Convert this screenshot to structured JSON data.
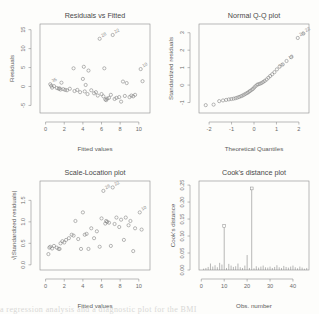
{
  "figure": {
    "background": "#fdfdfb",
    "foreground": "#6a6a6a",
    "layout": "2x2",
    "bottom_cutoff_text": "a regression analysis and a diagnostic plot for the BMI"
  },
  "chart_data": [
    {
      "type": "scatter",
      "title": "Residuals vs Fitted",
      "xlabel": "Fitted values",
      "ylabel": "Residuals",
      "xlim": [
        -0.6,
        11.2
      ],
      "ylim": [
        -7.0,
        16.5
      ],
      "xticks": [
        0,
        2,
        4,
        6,
        8,
        10
      ],
      "yticks": [
        -5,
        0,
        5,
        10,
        15
      ],
      "grid": false,
      "legend": "none",
      "x": [
        0.5,
        0.6,
        0.7,
        0.9,
        1.2,
        1.4,
        1.5,
        1.6,
        1.7,
        1.9,
        2.1,
        2.3,
        2.6,
        3.0,
        3.1,
        3.4,
        3.7,
        4.0,
        4.1,
        4.2,
        4.3,
        4.5,
        4.6,
        4.9,
        5.2,
        5.4,
        5.6,
        5.8,
        6.0,
        6.2,
        6.3,
        6.4,
        6.5,
        6.6,
        6.8,
        7.0,
        7.2,
        7.4,
        7.6,
        7.9,
        8.1,
        8.3,
        8.5,
        8.7,
        9.0,
        9.2,
        9.4,
        9.6,
        10.2,
        10.4
      ],
      "y": [
        0.6,
        0.2,
        -0.3,
        0.1,
        -0.4,
        -0.6,
        -0.5,
        -0.8,
        1.0,
        -0.7,
        -0.9,
        -1.0,
        -0.6,
        4.8,
        -1.2,
        -0.9,
        -1.5,
        2.0,
        5.2,
        -1.3,
        0.4,
        -2.0,
        4.2,
        -1.0,
        -1.8,
        -1.5,
        -2.4,
        12.6,
        -2.0,
        -2.6,
        4.8,
        -3.4,
        -3.6,
        -3.2,
        -3.0,
        -2.2,
        13.6,
        -3.3,
        -3.0,
        -2.8,
        -4.0,
        1.3,
        -2.5,
        0.9,
        -2.8,
        -2.4,
        -2.6,
        -2.2,
        4.6,
        1.4
      ],
      "labeled_points": [
        {
          "x": 5.8,
          "y": 12.6,
          "label": "28"
        },
        {
          "x": 7.2,
          "y": 13.6,
          "label": "22"
        },
        {
          "x": 10.2,
          "y": 4.6,
          "label": "10"
        },
        {
          "x": 0.5,
          "y": 0.6,
          "label": "35"
        }
      ]
    },
    {
      "type": "scatter",
      "title": "Normal Q-Q plot",
      "xlabel": "Theoretical Quantiles",
      "ylabel": "Standardized residuals",
      "xlim": [
        -2.45,
        2.45
      ],
      "ylim": [
        -1.6,
        3.5
      ],
      "xticks": [
        -2,
        -1,
        0,
        1,
        2
      ],
      "yticks": [
        -1,
        0,
        1,
        2,
        3
      ],
      "grid": false,
      "legend": "none",
      "x": [
        -2.15,
        -1.8,
        -1.55,
        -1.38,
        -1.24,
        -1.12,
        -1.01,
        -0.91,
        -0.82,
        -0.74,
        -0.66,
        -0.58,
        -0.51,
        -0.44,
        -0.37,
        -0.3,
        -0.24,
        -0.18,
        -0.11,
        -0.05,
        0.01,
        0.07,
        0.14,
        0.2,
        0.27,
        0.34,
        0.41,
        0.48,
        0.56,
        0.64,
        0.72,
        0.81,
        0.91,
        1.02,
        1.14,
        1.28,
        1.45,
        1.66,
        1.95,
        2.2
      ],
      "y": [
        -1.15,
        -1.12,
        -0.92,
        -0.88,
        -0.85,
        -0.82,
        -0.8,
        -0.78,
        -0.75,
        -0.72,
        -0.68,
        -0.64,
        -0.6,
        -0.55,
        -0.5,
        -0.45,
        -0.4,
        -0.34,
        -0.28,
        -0.22,
        -0.14,
        -0.06,
        0.02,
        0.05,
        0.08,
        0.12,
        0.18,
        0.24,
        0.32,
        0.42,
        0.52,
        0.62,
        0.74,
        0.9,
        1.05,
        1.18,
        1.38,
        1.6,
        2.7,
        2.95
      ],
      "labeled_points": [
        {
          "x": 2.2,
          "y": 2.95,
          "label": "22"
        },
        {
          "x": 1.95,
          "y": 2.7,
          "label": "28"
        },
        {
          "x": 1.45,
          "y": 1.38,
          "label": "10"
        },
        {
          "x": 1.02,
          "y": 0.9,
          "label": "33"
        }
      ]
    },
    {
      "type": "scatter",
      "title": "Scale-Location plot",
      "xlabel": "Fitted values",
      "ylabel": "√|Standardized residuals|",
      "xlim": [
        -0.6,
        11.2
      ],
      "ylim": [
        -0.12,
        1.95
      ],
      "xticks": [
        0,
        2,
        4,
        6,
        8,
        10
      ],
      "yticks": [
        0.0,
        0.5,
        1.0,
        1.5
      ],
      "ytick_labels": [
        "0.0",
        "0.5",
        "1.0",
        "1.5"
      ],
      "grid": false,
      "legend": "none",
      "x": [
        0.3,
        0.4,
        0.5,
        0.7,
        0.9,
        1.2,
        1.4,
        1.5,
        1.6,
        1.8,
        2.0,
        2.2,
        2.5,
        2.8,
        3.0,
        3.2,
        3.5,
        3.8,
        4.0,
        4.2,
        4.4,
        4.6,
        4.9,
        5.2,
        5.5,
        5.8,
        6.0,
        6.2,
        6.4,
        6.5,
        6.6,
        6.8,
        7.0,
        7.2,
        7.4,
        7.6,
        7.9,
        8.1,
        8.4,
        8.6,
        8.9,
        9.1,
        9.4,
        9.6,
        10.1,
        10.3
      ],
      "y": [
        0.25,
        0.4,
        0.42,
        0.38,
        0.44,
        0.4,
        0.37,
        0.37,
        0.5,
        0.55,
        0.52,
        0.58,
        0.62,
        0.7,
        0.68,
        1.02,
        0.6,
        0.37,
        1.22,
        0.7,
        0.72,
        0.37,
        0.85,
        0.62,
        0.78,
        0.42,
        1.08,
        1.72,
        0.96,
        1.02,
        1.0,
        0.98,
        0.44,
        1.8,
        0.95,
        1.1,
        0.88,
        1.05,
        0.58,
        1.1,
        0.92,
        1.02,
        0.32,
        0.85,
        1.22,
        0.82
      ],
      "labeled_points": [
        {
          "x": 6.2,
          "y": 1.72,
          "label": "28"
        },
        {
          "x": 7.2,
          "y": 1.8,
          "label": "22"
        },
        {
          "x": 10.1,
          "y": 1.22,
          "label": "10"
        }
      ]
    },
    {
      "type": "bar",
      "title": "Cook's distance plot",
      "xlabel": "Obs. number",
      "ylabel": "Cook's distance",
      "xlim": [
        -1,
        47
      ],
      "ylim": [
        0,
        0.262
      ],
      "xticks": [
        0,
        10,
        20,
        30,
        40
      ],
      "yticks": [
        0.0,
        0.05,
        0.1,
        0.15,
        0.2,
        0.25
      ],
      "ytick_labels": [
        "0.00",
        "0.05",
        "0.10",
        "0.15",
        "0.20",
        "0.25"
      ],
      "grid": false,
      "legend": "none",
      "categories": [
        1,
        2,
        3,
        4,
        5,
        6,
        7,
        8,
        9,
        10,
        11,
        12,
        13,
        14,
        15,
        16,
        17,
        18,
        19,
        20,
        21,
        22,
        23,
        24,
        25,
        26,
        27,
        28,
        29,
        30,
        31,
        32,
        33,
        34,
        35,
        36,
        37,
        38,
        39,
        40,
        41,
        42,
        43,
        44,
        45,
        46
      ],
      "values": [
        0.004,
        0.006,
        0.009,
        0.019,
        0.01,
        0.014,
        0.008,
        0.021,
        0.016,
        0.125,
        0.006,
        0.018,
        0.013,
        0.009,
        0.011,
        0.019,
        0.008,
        0.006,
        0.013,
        0.044,
        0.006,
        0.236,
        0.005,
        0.011,
        0.007,
        0.01,
        0.013,
        0.008,
        0.007,
        0.01,
        0.006,
        0.009,
        0.014,
        0.008,
        0.006,
        0.012,
        0.009,
        0.007,
        0.01,
        0.013,
        0.008,
        0.005,
        0.01,
        0.007,
        0.004,
        0.006
      ],
      "labeled_points": [
        {
          "x": 10,
          "y": 0.125,
          "label": "10"
        },
        {
          "x": 22,
          "y": 0.236,
          "label": "22"
        }
      ]
    }
  ]
}
